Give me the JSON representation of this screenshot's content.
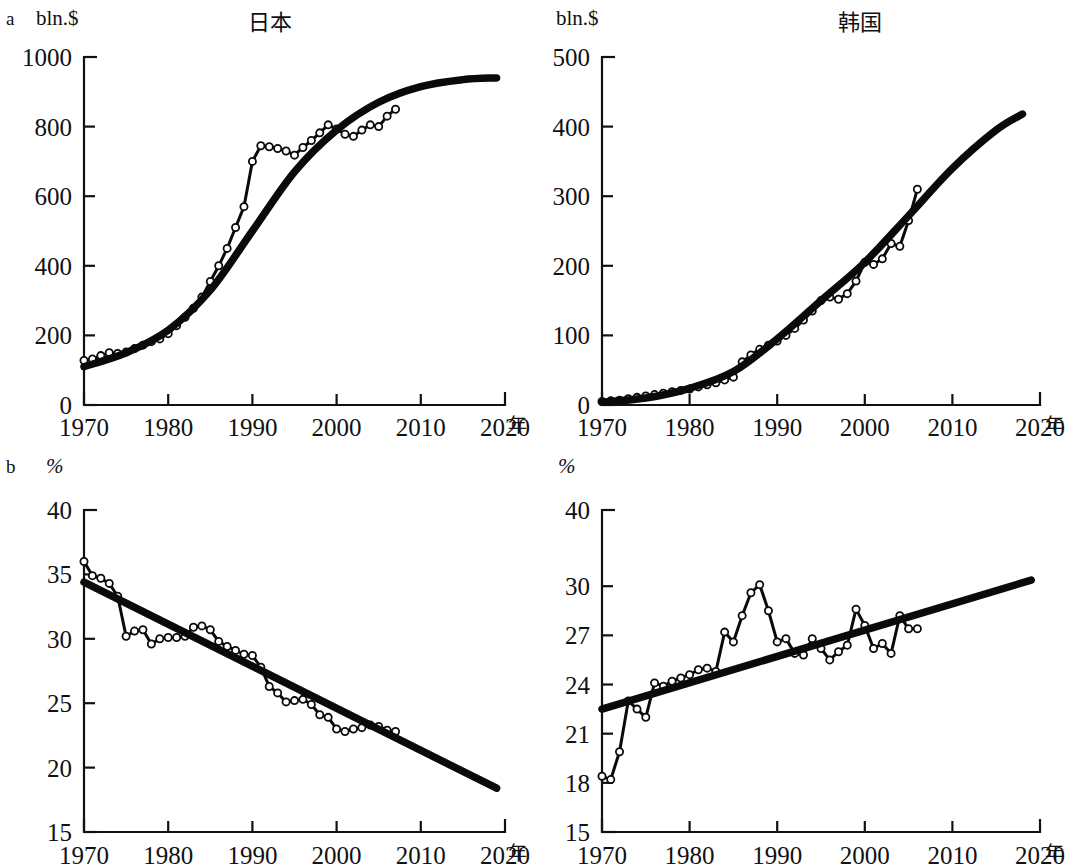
{
  "figure": {
    "panels": [
      {
        "letter": "a",
        "unit": "bln.$",
        "unit_italic": false,
        "title": "日本",
        "x_suffix": "年"
      },
      {
        "letter": "",
        "unit": "bln.$",
        "unit_italic": false,
        "title": "韩国",
        "x_suffix": "年",
        "x_prefix": "年"
      },
      {
        "letter": "b",
        "unit": "%",
        "unit_italic": true,
        "title": "",
        "x_suffix": "年"
      },
      {
        "letter": "",
        "unit": "%",
        "unit_italic": true,
        "title": "",
        "x_suffix": "年",
        "x_prefix": "年"
      }
    ],
    "colors": {
      "ink": "#111111",
      "trend": "#0a0a0a",
      "marker_fill": "#ffffff",
      "marker_stroke": "#0a0a0a"
    }
  },
  "chart_data": [
    {
      "id": "japan-exports",
      "type": "line",
      "title": "日本",
      "panel": "a",
      "xlabel": "年",
      "ylabel": "bln.$",
      "xlim": [
        1970,
        2020
      ],
      "ylim": [
        0,
        1000
      ],
      "xticks": [
        1970,
        1980,
        1990,
        2000,
        2010,
        2020
      ],
      "yticks": [
        0,
        200,
        400,
        600,
        800,
        1000
      ],
      "y_tick_spacing": "uniform",
      "grid": false,
      "legend": "none",
      "series": [
        {
          "name": "observed",
          "style": "markers-line",
          "x": [
            1970,
            1971,
            1972,
            1973,
            1974,
            1975,
            1976,
            1977,
            1978,
            1979,
            1980,
            1981,
            1982,
            1983,
            1984,
            1985,
            1986,
            1987,
            1988,
            1989,
            1990,
            1991,
            1992,
            1993,
            1994,
            1995,
            1996,
            1997,
            1998,
            1999,
            2000,
            2001,
            2002,
            2003,
            2004,
            2005,
            2006,
            2007
          ],
          "y": [
            128,
            132,
            142,
            150,
            148,
            152,
            162,
            172,
            182,
            190,
            205,
            228,
            252,
            278,
            310,
            355,
            400,
            450,
            510,
            570,
            700,
            745,
            742,
            737,
            730,
            718,
            740,
            760,
            782,
            805,
            793,
            778,
            772,
            790,
            805,
            800,
            830,
            850,
            900,
            935,
            960,
            1000
          ]
        },
        {
          "name": "logistic-trend",
          "style": "thick-curve",
          "x": [
            1970,
            1975,
            1980,
            1985,
            1990,
            1995,
            2000,
            2005,
            2010,
            2015,
            2019
          ],
          "y": [
            110,
            150,
            215,
            330,
            500,
            670,
            790,
            870,
            915,
            935,
            940
          ]
        }
      ]
    },
    {
      "id": "korea-exports",
      "type": "line",
      "title": "韩国",
      "panel": "a",
      "xlabel": "年",
      "ylabel": "bln.$",
      "xlim": [
        1970,
        2020
      ],
      "ylim": [
        0,
        500
      ],
      "xticks": [
        1970,
        1980,
        1990,
        2000,
        2010,
        2020
      ],
      "yticks": [
        0,
        100,
        200,
        300,
        400,
        500
      ],
      "y_tick_spacing": "uniform",
      "grid": false,
      "legend": "none",
      "series": [
        {
          "name": "observed",
          "style": "markers-line",
          "x": [
            1970,
            1971,
            1972,
            1973,
            1974,
            1975,
            1976,
            1977,
            1978,
            1979,
            1980,
            1981,
            1982,
            1983,
            1984,
            1985,
            1986,
            1987,
            1988,
            1989,
            1990,
            1991,
            1992,
            1993,
            1994,
            1995,
            1996,
            1997,
            1998,
            1999,
            2000,
            2001,
            2002,
            2003,
            2004,
            2005,
            2006
          ],
          "y": [
            5,
            6,
            7,
            9,
            11,
            13,
            15,
            17,
            19,
            21,
            23,
            26,
            29,
            32,
            36,
            40,
            62,
            72,
            80,
            86,
            92,
            100,
            110,
            122,
            135,
            150,
            155,
            152,
            160,
            178,
            205,
            202,
            210,
            232,
            228,
            265,
            310
          ]
        },
        {
          "name": "logistic-trend",
          "style": "thick-curve",
          "x": [
            1970,
            1975,
            1980,
            1985,
            1990,
            1995,
            2000,
            2005,
            2010,
            2015,
            2018
          ],
          "y": [
            4,
            10,
            24,
            48,
            95,
            150,
            205,
            272,
            340,
            395,
            418
          ]
        }
      ]
    },
    {
      "id": "japan-share",
      "type": "line",
      "title": "",
      "panel": "b",
      "xlabel": "年",
      "ylabel": "%",
      "xlim": [
        1970,
        2020
      ],
      "ylim": [
        15,
        40
      ],
      "xticks": [
        1970,
        1980,
        1990,
        2000,
        2010,
        2020
      ],
      "yticks": [
        15,
        20,
        25,
        30,
        35,
        40
      ],
      "y_tick_spacing": "uniform",
      "grid": false,
      "legend": "none",
      "series": [
        {
          "name": "observed",
          "style": "markers-line",
          "x": [
            1970,
            1971,
            1972,
            1973,
            1974,
            1975,
            1976,
            1977,
            1978,
            1979,
            1980,
            1981,
            1982,
            1983,
            1984,
            1985,
            1986,
            1987,
            1988,
            1989,
            1990,
            1991,
            1992,
            1993,
            1994,
            1995,
            1996,
            1997,
            1998,
            1999,
            2000,
            2001,
            2002,
            2003,
            2004,
            2005,
            2006,
            2007
          ],
          "y": [
            36.0,
            34.9,
            34.7,
            34.3,
            33.3,
            30.2,
            30.6,
            30.7,
            29.6,
            30.0,
            30.1,
            30.1,
            30.2,
            30.9,
            31.0,
            30.7,
            29.8,
            29.4,
            29.1,
            28.8,
            28.7,
            27.8,
            26.3,
            25.8,
            25.1,
            25.2,
            25.3,
            24.9,
            24.1,
            23.9,
            23.0,
            22.8,
            23.0,
            23.1,
            23.3,
            23.2,
            22.9,
            22.8
          ]
        },
        {
          "name": "linear-trend",
          "style": "thick-line",
          "x": [
            1970,
            2019
          ],
          "y": [
            34.4,
            18.4
          ]
        }
      ]
    },
    {
      "id": "korea-share",
      "type": "line",
      "title": "",
      "panel": "b",
      "xlabel": "年",
      "ylabel": "%",
      "xlim": [
        1970,
        2020
      ],
      "ylim": [
        15,
        40
      ],
      "xticks": [
        1970,
        1980,
        1990,
        2000,
        2010,
        2020
      ],
      "yticks": [
        15,
        18,
        21,
        24,
        27,
        30,
        40
      ],
      "y_tick_spacing": "nonuniform",
      "grid": false,
      "legend": "none",
      "series": [
        {
          "name": "observed",
          "style": "markers-line",
          "x": [
            1970,
            1971,
            1972,
            1973,
            1974,
            1975,
            1976,
            1977,
            1978,
            1979,
            1980,
            1981,
            1982,
            1983,
            1984,
            1985,
            1986,
            1987,
            1988,
            1989,
            1990,
            1991,
            1992,
            1993,
            1994,
            1995,
            1996,
            1997,
            1998,
            1999,
            2000,
            2001,
            2002,
            2003,
            2004,
            2005,
            2006
          ],
          "y": [
            18.4,
            18.2,
            19.9,
            23.0,
            22.5,
            22.0,
            24.1,
            23.9,
            24.2,
            24.4,
            24.6,
            24.9,
            25.0,
            24.8,
            27.2,
            26.6,
            28.2,
            29.6,
            30.2,
            28.5,
            26.6,
            26.8,
            25.9,
            25.8,
            26.8,
            26.2,
            25.5,
            26.0,
            26.4,
            28.6,
            27.6,
            26.2,
            26.5,
            25.9,
            28.2,
            27.4,
            27.4
          ]
        },
        {
          "name": "linear-trend",
          "style": "thick-line",
          "x": [
            1970,
            2019
          ],
          "y": [
            22.5,
            30.8
          ]
        }
      ]
    }
  ]
}
